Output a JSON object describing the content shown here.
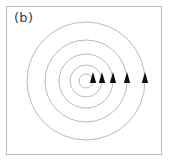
{
  "figure": {
    "panel_label": "(b)",
    "frame": {
      "x": 6,
      "y": 6,
      "width": 156,
      "height": 149,
      "border_color": "#b9b9b9"
    },
    "background_color": "#ffffff",
    "line_color": "#a8a8a8",
    "arrow_color": "#111111"
  },
  "chart_data": {
    "type": "line",
    "title": "(b)",
    "subtitle": "",
    "xlabel": "",
    "ylabel": "",
    "plot_kind": "streamline-vector-field",
    "grid": false,
    "legend": null,
    "axis_ticks": [],
    "tick_labels": [],
    "center": {
      "x": 86,
      "y": 81
    },
    "series": [
      {
        "name": "streamline-1",
        "radius": 7,
        "arrow": {
          "x": 93,
          "y": 81,
          "direction": "up",
          "angle_deg": 0
        }
      },
      {
        "name": "streamline-2",
        "radius": 16,
        "arrow": {
          "x": 102,
          "y": 81,
          "direction": "up",
          "angle_deg": 0
        }
      },
      {
        "name": "streamline-3",
        "radius": 27,
        "arrow": {
          "x": 113,
          "y": 81,
          "direction": "up",
          "angle_deg": 0
        }
      },
      {
        "name": "streamline-4",
        "radius": 41,
        "arrow": {
          "x": 127,
          "y": 81,
          "direction": "up",
          "angle_deg": 0
        }
      },
      {
        "name": "streamline-5",
        "radius": 59,
        "arrow": {
          "x": 145,
          "y": 81,
          "direction": "up",
          "angle_deg": 0
        }
      }
    ],
    "arrow_marker": {
      "shape": "filled-triangle",
      "half_width": 3.2,
      "height": 11,
      "count": 5
    },
    "circulation": "counterclockwise"
  }
}
